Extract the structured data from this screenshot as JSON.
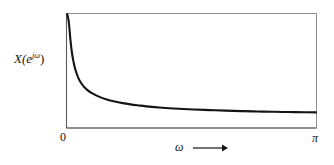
{
  "figure": {
    "background_color": "#ffffff",
    "line_color": "#141414",
    "frame_color": "#8c8c8c"
  },
  "labels": {
    "y_axis_base": "X(e",
    "y_axis_exponent": "jω",
    "y_axis_close": ")",
    "x_axis_variable": "ω",
    "tick_zero": "0",
    "tick_pi": "π"
  },
  "chart_data": {
    "type": "line",
    "title": "",
    "xlabel": "ω",
    "ylabel": "X(e^{jω})",
    "xlim": [
      0,
      3.141592653589793
    ],
    "ylim": [
      0,
      1
    ],
    "xtick_values": [
      0,
      3.141592653589793
    ],
    "xtick_labels": [
      "0",
      "π"
    ],
    "ytick_values": [],
    "ytick_labels": [],
    "grid": false,
    "legend": null,
    "frame": "full-box",
    "annotations": [
      {
        "text": "ω ⟶",
        "position": "below-axis-center"
      }
    ],
    "x": [
      0.0,
      0.02,
      0.04,
      0.06,
      0.08,
      0.1,
      0.14,
      0.18,
      0.22,
      0.26,
      0.3,
      0.4,
      0.5,
      0.6,
      0.7,
      0.8,
      0.9,
      1.0,
      1.2,
      1.4,
      1.6,
      1.8,
      2.0,
      2.2,
      2.4,
      2.6,
      2.8,
      3.0,
      3.1416
    ],
    "y": [
      1.0,
      0.93,
      0.78,
      0.66,
      0.58,
      0.52,
      0.44,
      0.39,
      0.355,
      0.33,
      0.31,
      0.275,
      0.25,
      0.232,
      0.218,
      0.207,
      0.198,
      0.19,
      0.178,
      0.169,
      0.162,
      0.157,
      0.152,
      0.148,
      0.145,
      0.142,
      0.14,
      0.138,
      0.137
    ]
  }
}
